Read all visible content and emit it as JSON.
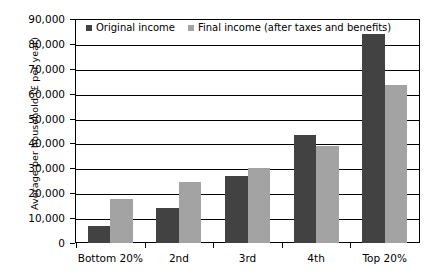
{
  "chart_data": {
    "type": "bar",
    "title": "",
    "subtitle": "",
    "xlabel": "",
    "ylabel": "Average per household (£ per year)",
    "categories": [
      "Bottom 20%",
      "2nd",
      "3rd",
      "4th",
      "Top 20%"
    ],
    "series": [
      {
        "name": "Original income",
        "color": "#424242",
        "values": [
          7000,
          14000,
          27000,
          43500,
          85000
        ]
      },
      {
        "name": "Final income (after taxes and benefits)",
        "color": "#a3a3a3",
        "values": [
          17500,
          24500,
          30000,
          39000,
          63500
        ]
      }
    ],
    "ylim": [
      0,
      90000
    ],
    "ytick_values": [
      0,
      10000,
      20000,
      30000,
      40000,
      50000,
      60000,
      70000,
      80000,
      90000
    ],
    "ytick_labels": [
      "0",
      "10,000",
      "20,000",
      "30,000",
      "40,000",
      "50,000",
      "60,000",
      "70,000",
      "80,000",
      "90,000"
    ],
    "grid": true,
    "grid_axis": "y",
    "legend_position": "top-left-inside"
  },
  "legend": {
    "items": [
      {
        "label": "Original income",
        "color": "#424242"
      },
      {
        "label": "Final income (after taxes and benefits)",
        "color": "#a3a3a3"
      }
    ]
  },
  "axes": {
    "y_title": "Average per household (£ per year)"
  }
}
